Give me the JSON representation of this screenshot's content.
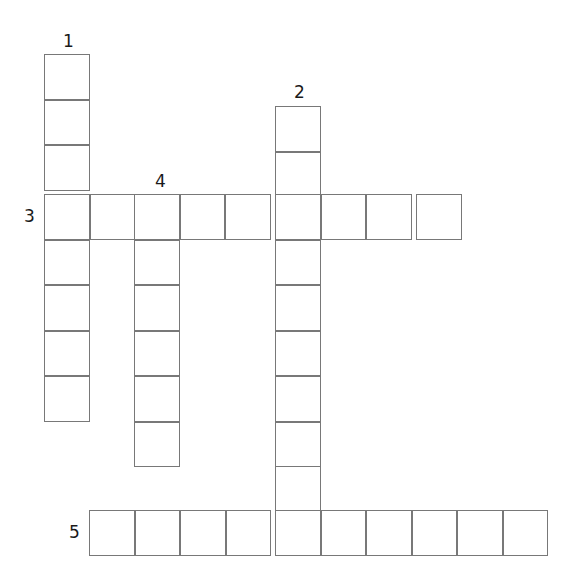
{
  "puzzle": {
    "kind": "crossword-grid",
    "title": "Crossword puzzle grid",
    "canvas": {
      "width": 585,
      "height": 585
    },
    "style": {
      "cell_size": 45.5,
      "border_color": "#787878",
      "border_width": 1.4,
      "cell_fill": "#ffffff",
      "background": "#ffffff",
      "number_color": "#1a1a1a",
      "number_font_size": 17
    },
    "entries": [
      {
        "number": "1",
        "direction": "down",
        "length": 8,
        "label_x": 63,
        "label_y": 33,
        "start_x": 44,
        "start_y": 54
      },
      {
        "number": "2",
        "direction": "down",
        "length": 10,
        "label_x": 294,
        "label_y": 84,
        "start_x": 275,
        "start_y": 106
      },
      {
        "number": "3",
        "direction": "across",
        "length": 9,
        "label_x": 24,
        "label_y": 208,
        "start_x": 44,
        "start_y": 194
      },
      {
        "number": "4",
        "direction": "down",
        "length": 6,
        "label_x": 155,
        "label_y": 173,
        "start_x": 134,
        "start_y": 194
      },
      {
        "number": "5",
        "direction": "across",
        "length": 10,
        "label_x": 69,
        "label_y": 524,
        "start_x": 89,
        "start_y": 510
      }
    ],
    "cells": [
      {
        "name": "cell-1d-1",
        "x": 44,
        "y": 54
      },
      {
        "name": "cell-1d-2",
        "x": 44,
        "y": 99.5
      },
      {
        "name": "cell-1d-3",
        "x": 44,
        "y": 145
      },
      {
        "name": "cell-1d-4",
        "x": 44,
        "y": 194
      },
      {
        "name": "cell-1d-5",
        "x": 44,
        "y": 239.5
      },
      {
        "name": "cell-1d-6",
        "x": 44,
        "y": 285
      },
      {
        "name": "cell-1d-7",
        "x": 44,
        "y": 330.5
      },
      {
        "name": "cell-1d-8",
        "x": 44,
        "y": 376
      },
      {
        "name": "cell-2d-1",
        "x": 275,
        "y": 106
      },
      {
        "name": "cell-2d-2",
        "x": 275,
        "y": 151.5
      },
      {
        "name": "cell-2d-3",
        "x": 275,
        "y": 194
      },
      {
        "name": "cell-2d-4",
        "x": 275,
        "y": 239.5
      },
      {
        "name": "cell-2d-5",
        "x": 275,
        "y": 285
      },
      {
        "name": "cell-2d-6",
        "x": 275,
        "y": 330.5
      },
      {
        "name": "cell-2d-7",
        "x": 275,
        "y": 376
      },
      {
        "name": "cell-2d-8",
        "x": 275,
        "y": 421.5
      },
      {
        "name": "cell-2d-9",
        "x": 275,
        "y": 466
      },
      {
        "name": "cell-2d-10",
        "x": 275,
        "y": 510
      },
      {
        "name": "cell-3a-1",
        "x": 44,
        "y": 194
      },
      {
        "name": "cell-3a-2",
        "x": 89.5,
        "y": 194
      },
      {
        "name": "cell-3a-3",
        "x": 134,
        "y": 194
      },
      {
        "name": "cell-3a-4",
        "x": 179.5,
        "y": 194
      },
      {
        "name": "cell-3a-5",
        "x": 225,
        "y": 194
      },
      {
        "name": "cell-3a-6",
        "x": 275,
        "y": 194
      },
      {
        "name": "cell-3a-7",
        "x": 320.5,
        "y": 194
      },
      {
        "name": "cell-3a-8",
        "x": 366,
        "y": 194
      },
      {
        "name": "cell-3a-9",
        "x": 416,
        "y": 194
      },
      {
        "name": "cell-4d-1",
        "x": 134,
        "y": 194
      },
      {
        "name": "cell-4d-2",
        "x": 134,
        "y": 239.5
      },
      {
        "name": "cell-4d-3",
        "x": 134,
        "y": 285
      },
      {
        "name": "cell-4d-4",
        "x": 134,
        "y": 330.5
      },
      {
        "name": "cell-4d-5",
        "x": 134,
        "y": 376
      },
      {
        "name": "cell-4d-6",
        "x": 134,
        "y": 421.5
      },
      {
        "name": "cell-5a-1",
        "x": 89,
        "y": 510
      },
      {
        "name": "cell-5a-2",
        "x": 134.5,
        "y": 510
      },
      {
        "name": "cell-5a-3",
        "x": 180,
        "y": 510
      },
      {
        "name": "cell-5a-4",
        "x": 225.5,
        "y": 510
      },
      {
        "name": "cell-5a-5",
        "x": 275,
        "y": 510
      },
      {
        "name": "cell-5a-6",
        "x": 320.5,
        "y": 510
      },
      {
        "name": "cell-5a-7",
        "x": 366,
        "y": 510
      },
      {
        "name": "cell-5a-8",
        "x": 411.5,
        "y": 510
      },
      {
        "name": "cell-5a-9",
        "x": 457,
        "y": 510
      },
      {
        "name": "cell-5a-10",
        "x": 502.5,
        "y": 510
      }
    ]
  }
}
